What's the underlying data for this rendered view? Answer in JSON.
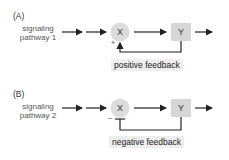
{
  "panels": [
    {
      "label": "(A)",
      "pathway_line1": "signaling",
      "pathway_line2": "pathway 1",
      "node_x": "X",
      "node_y": "Y",
      "sign": "+",
      "feedback": "positive feedback"
    },
    {
      "label": "(B)",
      "pathway_line1": "signaling",
      "pathway_line2": "pathway 2",
      "node_x": "X",
      "node_y": "Y",
      "sign": "–",
      "feedback": "negative feedback"
    }
  ],
  "colors": {
    "node_fill": "#dcdcdc",
    "box_fill": "#d6d6d6",
    "label_bg": "#eeeeee",
    "line": "#222222"
  }
}
